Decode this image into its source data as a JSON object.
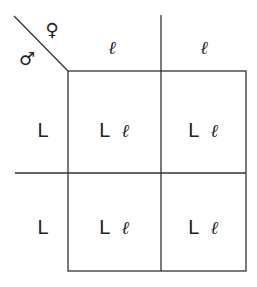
{
  "diagram": {
    "type": "punnett-square",
    "header_labels": {
      "female_symbol": "♀",
      "male_symbol": "♂"
    },
    "columns": [
      "ℓ",
      "ℓ"
    ],
    "rows": [
      "L",
      "L"
    ],
    "cells": [
      [
        {
          "a": "L",
          "b": "ℓ"
        },
        {
          "a": "L",
          "b": "ℓ"
        }
      ],
      [
        {
          "a": "L",
          "b": "ℓ"
        },
        {
          "a": "L",
          "b": "ℓ"
        }
      ]
    ],
    "line_color": "#333333"
  }
}
